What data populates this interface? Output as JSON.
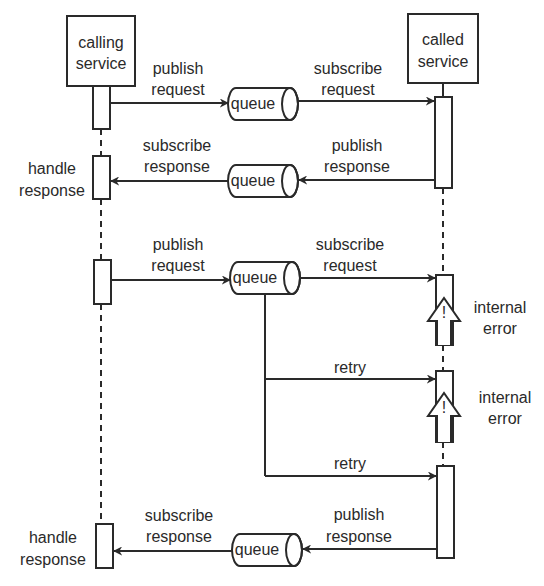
{
  "participants": {
    "caller": {
      "line1": "calling",
      "line2": "service"
    },
    "callee": {
      "line1": "called",
      "line2": "service"
    }
  },
  "queue_label": "queue",
  "flow1": {
    "publish_request": {
      "line1": "publish",
      "line2": "request"
    },
    "subscribe_request": {
      "line1": "subscribe",
      "line2": "request"
    },
    "publish_response": {
      "line1": "publish",
      "line2": "response"
    },
    "subscribe_response": {
      "line1": "subscribe",
      "line2": "response"
    },
    "handle_response": {
      "line1": "handle",
      "line2": "response"
    }
  },
  "flow2": {
    "publish_request": {
      "line1": "publish",
      "line2": "request"
    },
    "subscribe_request": {
      "line1": "subscribe",
      "line2": "request"
    },
    "error1": {
      "line1": "internal",
      "line2": "error"
    },
    "retry1": "retry",
    "error2": {
      "line1": "internal",
      "line2": "error"
    },
    "retry2": "retry",
    "publish_response": {
      "line1": "publish",
      "line2": "response"
    },
    "subscribe_response": {
      "line1": "subscribe",
      "line2": "response"
    },
    "handle_response": {
      "line1": "handle",
      "line2": "response"
    }
  },
  "warning_glyph": "!",
  "colors": {
    "stroke": "#2a2a2a",
    "background": "#ffffff"
  }
}
